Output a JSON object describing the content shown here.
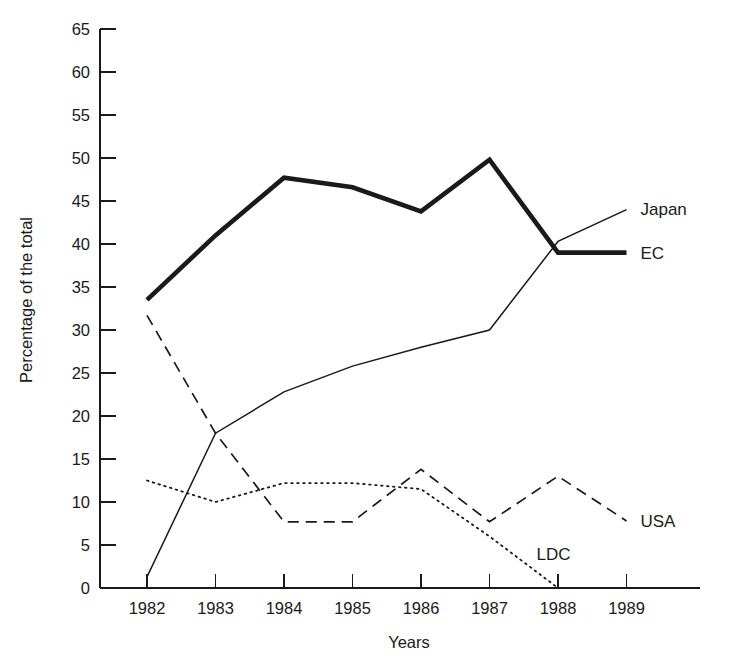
{
  "chart_data": {
    "type": "line",
    "title": "",
    "xlabel": "Years",
    "ylabel": "Percentage of the total",
    "x": [
      1982,
      1983,
      1984,
      1985,
      1986,
      1987,
      1988,
      1989
    ],
    "categories": [
      "1982",
      "1983",
      "1984",
      "1985",
      "1986",
      "1987",
      "1988",
      "1989"
    ],
    "xlim": [
      1982,
      1989
    ],
    "ylim": [
      0,
      65
    ],
    "yticks": [
      0,
      5,
      10,
      15,
      20,
      25,
      30,
      35,
      40,
      45,
      50,
      55,
      60,
      65
    ],
    "ytick_labels": [
      "0",
      "5",
      "10",
      "15",
      "20",
      "25",
      "30",
      "35",
      "40",
      "45",
      "50",
      "55",
      "60",
      "65"
    ],
    "xticks": [
      1982,
      1983,
      1984,
      1985,
      1986,
      1987,
      1988,
      1989
    ],
    "xtick_labels": [
      "1982",
      "1983",
      "1984",
      "1985",
      "1986",
      "1987",
      "1988",
      "1989"
    ],
    "grid": false,
    "legend_position": "right-inline-labels",
    "series": [
      {
        "name": "EC",
        "label": "EC",
        "style": "solid-thick",
        "color": "#1a1a1a",
        "x": [
          1982,
          1983,
          1984,
          1985,
          1986,
          1987,
          1988,
          1989
        ],
        "values": [
          33.5,
          41.0,
          47.7,
          46.6,
          43.8,
          49.8,
          39.0,
          39.0
        ]
      },
      {
        "name": "Japan",
        "label": "Japan",
        "style": "solid-thin",
        "color": "#1a1a1a",
        "x": [
          1982,
          1983,
          1984,
          1985,
          1986,
          1987,
          1988,
          1989
        ],
        "values": [
          1.3,
          18.0,
          22.8,
          25.8,
          28.0,
          30.0,
          40.3,
          44.0
        ]
      },
      {
        "name": "USA",
        "label": "USA",
        "style": "dashed",
        "color": "#1a1a1a",
        "x": [
          1982,
          1983,
          1984,
          1985,
          1986,
          1987,
          1988,
          1989
        ],
        "values": [
          31.7,
          18.0,
          7.7,
          7.7,
          13.8,
          7.7,
          13.0,
          7.8
        ]
      },
      {
        "name": "LDC",
        "label": "LDC",
        "style": "dotted",
        "color": "#1a1a1a",
        "x": [
          1982,
          1983,
          1984,
          1985,
          1986,
          1987,
          1988
        ],
        "values": [
          12.5,
          10.0,
          12.2,
          12.2,
          11.5,
          6.0,
          0.0
        ]
      }
    ],
    "annotations": [
      {
        "text": "Japan",
        "for_series": "Japan",
        "at_x": 1989,
        "at_y": 44.0
      },
      {
        "text": "EC",
        "for_series": "EC",
        "at_x": 1989,
        "at_y": 39.0
      },
      {
        "text": "USA",
        "for_series": "USA",
        "at_x": 1989,
        "at_y": 7.8
      },
      {
        "text": "LDC",
        "for_series": "LDC",
        "at_x": 1987.6,
        "at_y": 4.0
      }
    ]
  }
}
